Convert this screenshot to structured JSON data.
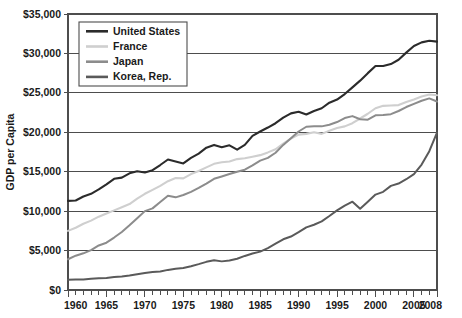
{
  "chart_data": {
    "type": "line",
    "title": "",
    "xlabel": "",
    "ylabel": "GDP per Capita",
    "xlim": [
      1960,
      2008
    ],
    "ylim": [
      0,
      35000
    ],
    "grid": true,
    "legend_position": "top-left-inside",
    "y_ticks": [
      0,
      5000,
      10000,
      15000,
      20000,
      25000,
      30000,
      35000
    ],
    "y_tick_labels": [
      "$0",
      "$5,000",
      "$10,000",
      "$15,000",
      "$20,000",
      "$25,000",
      "$30,000",
      "$35,000"
    ],
    "x_ticks": [
      1960,
      1965,
      1970,
      1975,
      1980,
      1985,
      1990,
      1995,
      2000,
      2005,
      2008
    ],
    "x_tick_labels": [
      "1960",
      "1965",
      "1970",
      "1975",
      "1980",
      "1985",
      "1990",
      "1995",
      "2000",
      "2005",
      "2008"
    ],
    "x_minor_tick_interval": 1,
    "x": [
      1960,
      1961,
      1962,
      1963,
      1964,
      1965,
      1966,
      1967,
      1968,
      1969,
      1970,
      1971,
      1972,
      1973,
      1974,
      1975,
      1976,
      1977,
      1978,
      1979,
      1980,
      1981,
      1982,
      1983,
      1984,
      1985,
      1986,
      1987,
      1988,
      1989,
      1990,
      1991,
      1992,
      1993,
      1994,
      1995,
      1996,
      1997,
      1998,
      1999,
      2000,
      2001,
      2002,
      2003,
      2004,
      2005,
      2006,
      2007,
      2008
    ],
    "series": [
      {
        "name": "United States",
        "color": "#2b2b2b",
        "values": [
          11300,
          11350,
          11850,
          12200,
          12750,
          13400,
          14100,
          14250,
          14800,
          15050,
          14900,
          15200,
          15850,
          16550,
          16300,
          16050,
          16750,
          17300,
          18050,
          18400,
          18100,
          18350,
          17800,
          18400,
          19550,
          20100,
          20600,
          21150,
          21850,
          22400,
          22600,
          22250,
          22700,
          23050,
          23750,
          24150,
          24850,
          25700,
          26550,
          27500,
          28400,
          28400,
          28650,
          29200,
          30100,
          30950,
          31400,
          31600,
          31500
        ]
      },
      {
        "name": "France",
        "color": "#cfcfcf",
        "values": [
          7500,
          7900,
          8400,
          8800,
          9300,
          9700,
          10100,
          10500,
          10900,
          11600,
          12200,
          12700,
          13200,
          13800,
          14200,
          14150,
          14700,
          15100,
          15550,
          16000,
          16200,
          16300,
          16600,
          16700,
          16900,
          17100,
          17450,
          17850,
          18550,
          19200,
          19700,
          19800,
          20000,
          19800,
          20200,
          20550,
          20750,
          21150,
          21750,
          22350,
          23050,
          23350,
          23400,
          23450,
          23850,
          24150,
          24550,
          24800,
          24700
        ]
      },
      {
        "name": "Japan",
        "color": "#8c8c8c",
        "values": [
          3900,
          4350,
          4650,
          5050,
          5650,
          6000,
          6650,
          7350,
          8200,
          9100,
          10000,
          10350,
          11150,
          11950,
          11750,
          12050,
          12450,
          12950,
          13500,
          14100,
          14400,
          14700,
          15000,
          15250,
          15800,
          16400,
          16750,
          17400,
          18400,
          19250,
          20100,
          20700,
          20750,
          20750,
          20950,
          21300,
          21800,
          22050,
          21650,
          21600,
          22150,
          22200,
          22300,
          22700,
          23200,
          23600,
          24000,
          24300,
          23900
        ]
      },
      {
        "name": "Korea, Rep.",
        "color": "#5a5a5a",
        "values": [
          1300,
          1320,
          1340,
          1420,
          1480,
          1530,
          1640,
          1720,
          1850,
          2010,
          2150,
          2280,
          2350,
          2550,
          2700,
          2800,
          3020,
          3280,
          3570,
          3760,
          3630,
          3740,
          3960,
          4320,
          4620,
          4870,
          5320,
          5870,
          6430,
          6780,
          7330,
          7940,
          8280,
          8700,
          9380,
          10100,
          10700,
          11200,
          10300,
          11200,
          12100,
          12450,
          13200,
          13500,
          14050,
          14700,
          15900,
          17600,
          19950
        ]
      }
    ]
  },
  "legend": {
    "entries": [
      {
        "label": "United States"
      },
      {
        "label": "France"
      },
      {
        "label": "Japan"
      },
      {
        "label": "Korea, Rep."
      }
    ]
  },
  "axes": {
    "y_title": "GDP per Capita"
  }
}
